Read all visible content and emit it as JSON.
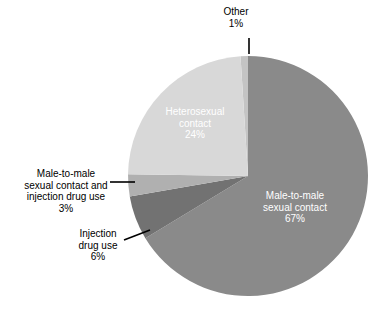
{
  "chart_data": {
    "type": "pie",
    "title": "",
    "subtitle": "",
    "legend": "none",
    "start_angle_deg": -90,
    "direction": "clockwise",
    "center": [
      248,
      176
    ],
    "radius": 120,
    "categories": [
      "Male-to-male sexual contact",
      "Injection drug use",
      "Male-to-male sexual contact and injection drug use",
      "Heterosexual contact",
      "Other"
    ],
    "values": [
      67,
      6,
      3,
      24,
      1
    ],
    "value_unit": "%",
    "colors": [
      "#8a8a8a",
      "#727272",
      "#b0b0b0",
      "#d8d8d8",
      "#c4c4c4"
    ],
    "slices": [
      {
        "name": "Male-to-male sexual contact",
        "value": 67,
        "pct_text": "67%",
        "color": "#8a8a8a",
        "label_lines": [
          "Male-to-male",
          "sexual contact"
        ],
        "label_position": "inside",
        "label_color": "#ffffff"
      },
      {
        "name": "Injection drug use",
        "value": 6,
        "pct_text": "6%",
        "color": "#727272",
        "label_lines": [
          "Injection",
          "drug use"
        ],
        "label_position": "outside",
        "label_color": "#000000",
        "leader": "diagonal"
      },
      {
        "name": "Male-to-male sexual contact and injection drug use",
        "value": 3,
        "pct_text": "3%",
        "color": "#b0b0b0",
        "label_lines": [
          "Male-to-male",
          "sexual contact and",
          "injection drug use"
        ],
        "label_position": "outside",
        "label_color": "#000000",
        "leader": "horizontal"
      },
      {
        "name": "Heterosexual contact",
        "value": 24,
        "pct_text": "24%",
        "color": "#d8d8d8",
        "label_lines": [
          "Heterosexual",
          "contact"
        ],
        "label_position": "inside",
        "label_color": "#ffffff"
      },
      {
        "name": "Other",
        "value": 1,
        "pct_text": "1%",
        "color": "#c4c4c4",
        "label_lines": [
          "Other"
        ],
        "label_position": "outside",
        "label_color": "#000000",
        "leader": "vertical"
      }
    ]
  },
  "labels": {
    "other": {
      "line1": "Other",
      "pct": "1%"
    },
    "heterosexual": {
      "line1": "Heterosexual",
      "line2": "contact",
      "pct": "24%"
    },
    "male_to_male": {
      "line1": "Male-to-male",
      "line2": "sexual contact",
      "pct": "67%"
    },
    "mmsc_idu": {
      "line1": "Male-to-male",
      "line2": "sexual contact and",
      "line3": "injection drug use",
      "pct": "3%"
    },
    "injection_drug_use": {
      "line1": "Injection",
      "line2": "drug use",
      "pct": "6%"
    }
  }
}
